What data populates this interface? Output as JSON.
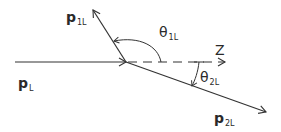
{
  "diagram": {
    "title": "",
    "colors": {
      "line": "#333333",
      "text": "#2a2a2a",
      "background": "#ffffff"
    },
    "labels": {
      "p1": {
        "base": "p",
        "sub": "1L"
      },
      "theta1": {
        "base": "θ",
        "sub": "1L"
      },
      "z_axis": "Z",
      "pL": {
        "base": "p",
        "sub": "L"
      },
      "theta2": {
        "base": "θ",
        "sub": "2L"
      },
      "p2": {
        "base": "p",
        "sub": "2L"
      }
    },
    "elements": [
      {
        "id": "incoming-momentum",
        "label": "p_L",
        "from": [
          15,
          62
        ],
        "to": [
          126,
          62
        ],
        "style": "solid",
        "arrow": "end"
      },
      {
        "id": "outgoing-momentum-1",
        "label": "p_1L",
        "from": [
          126,
          62
        ],
        "to": [
          93,
          10
        ],
        "style": "solid",
        "arrow": "end"
      },
      {
        "id": "outgoing-momentum-2",
        "label": "p_2L",
        "from": [
          126,
          62
        ],
        "to": [
          266,
          112
        ],
        "style": "solid",
        "arrow": "end"
      },
      {
        "id": "z-axis",
        "label": "Z",
        "from": [
          126,
          62
        ],
        "to": [
          225,
          62
        ],
        "style": "dashed",
        "arrow": "end"
      },
      {
        "id": "angle-theta-1L",
        "label": "θ_1L",
        "between": [
          "z-axis",
          "p_1L"
        ]
      },
      {
        "id": "angle-theta-2L",
        "label": "θ_2L",
        "between": [
          "z-axis",
          "p_2L"
        ]
      }
    ]
  }
}
